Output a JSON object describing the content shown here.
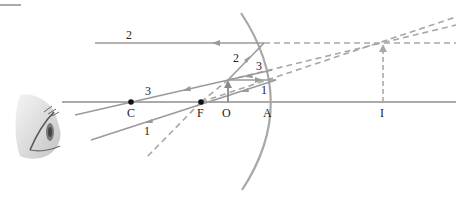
{
  "figure": {
    "type": "ray-diagram",
    "colors": {
      "ray": "#9a9a9a",
      "axis": "#555555",
      "mirror": "#a8a8a8",
      "point": "#111111",
      "text": "#222222"
    }
  },
  "points": {
    "C": "C",
    "F": "F",
    "O": "O",
    "A": "A",
    "I": "I"
  },
  "rays": {
    "ray1": "1",
    "ray1_reflected": "1",
    "ray2": "2",
    "ray2_reflected": "2",
    "ray3": "3",
    "ray3_reflected": "3"
  },
  "icons": {
    "eye": "eye-icon"
  }
}
